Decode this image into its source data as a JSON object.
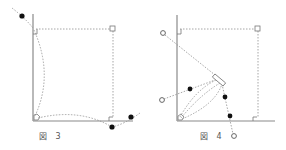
{
  "figures": [
    {
      "id": "fig3",
      "caption": "図 3",
      "caption_pos": [
        39,
        131
      ]
    },
    {
      "id": "fig4",
      "caption": "図 4",
      "caption_pos": [
        200,
        131
      ]
    }
  ],
  "colors": {
    "axis": "#8a8a8a",
    "dotted": "#8f8f8f",
    "point": "#111111",
    "hollow": "#666666"
  }
}
